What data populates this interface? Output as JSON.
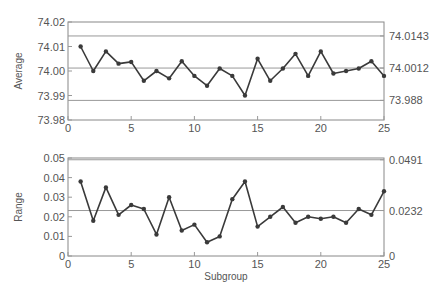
{
  "chart_data": [
    {
      "type": "line",
      "title": "",
      "xlabel": "",
      "ylabel": "Average",
      "x": [
        1,
        2,
        3,
        4,
        5,
        6,
        7,
        8,
        9,
        10,
        11,
        12,
        13,
        14,
        15,
        16,
        17,
        18,
        19,
        20,
        21,
        22,
        23,
        24,
        25
      ],
      "series": [
        {
          "name": "Average",
          "values": [
            74.01,
            74.0,
            74.008,
            74.003,
            74.0037,
            73.996,
            74.0,
            73.997,
            74.004,
            73.998,
            73.994,
            74.001,
            73.998,
            73.99,
            74.005,
            73.996,
            74.001,
            74.007,
            73.998,
            74.008,
            73.999,
            74.0,
            74.001,
            74.004,
            73.998
          ]
        }
      ],
      "ylim": [
        73.98,
        74.02
      ],
      "xlim": [
        0,
        25
      ],
      "yticks": [
        "73.98",
        "73.99",
        "74.00",
        "74.01",
        "74.02"
      ],
      "xticks": [
        "0",
        "5",
        "10",
        "15",
        "20",
        "25"
      ],
      "control_limits": {
        "UCL": 74.0143,
        "CL": 74.0012,
        "LCL": 73.988
      },
      "control_limit_labels": [
        "74.0143",
        "74.0012",
        "73.988"
      ],
      "grid": false
    },
    {
      "type": "line",
      "title": "",
      "xlabel": "Subgroup",
      "ylabel": "Range",
      "x": [
        1,
        2,
        3,
        4,
        5,
        6,
        7,
        8,
        9,
        10,
        11,
        12,
        13,
        14,
        15,
        16,
        17,
        18,
        19,
        20,
        21,
        22,
        23,
        24,
        25
      ],
      "series": [
        {
          "name": "Range",
          "values": [
            0.038,
            0.018,
            0.035,
            0.021,
            0.026,
            0.024,
            0.011,
            0.03,
            0.013,
            0.016,
            0.007,
            0.01,
            0.029,
            0.038,
            0.015,
            0.02,
            0.025,
            0.017,
            0.02,
            0.019,
            0.02,
            0.017,
            0.024,
            0.021,
            0.033
          ]
        }
      ],
      "ylim": [
        0,
        0.05
      ],
      "xlim": [
        0,
        25
      ],
      "yticks": [
        "0",
        "0.01",
        "0.02",
        "0.03",
        "0.04",
        "0.05"
      ],
      "xticks": [
        "0",
        "5",
        "10",
        "15",
        "20",
        "25"
      ],
      "control_limits": {
        "UCL": 0.0491,
        "CL": 0.0232,
        "LCL": 0
      },
      "control_limit_labels": [
        "0.0491",
        "0.0232",
        "0"
      ],
      "grid": false
    }
  ],
  "labels": {
    "top_ylabel": "Average",
    "bottom_ylabel": "Range",
    "bottom_xlabel": "Subgroup"
  },
  "colors": {
    "line": "#3a3a3a",
    "control": "#999999",
    "frame": "#888888"
  }
}
